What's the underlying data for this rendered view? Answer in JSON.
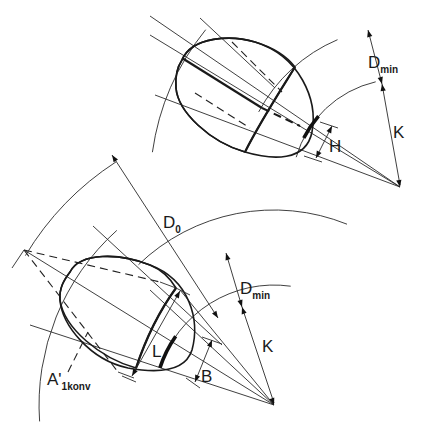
{
  "diagram": {
    "title": "",
    "colors": {
      "ink": "#1a1a1a",
      "shade": "#c9c9c9",
      "background": "#ffffff"
    },
    "top_view": {
      "labels": {
        "d_min": "D",
        "d_min_sub": "min",
        "k": "K",
        "h": "H"
      }
    },
    "bottom_view": {
      "labels": {
        "d_0": "D",
        "d_0_sub": "0",
        "d_min": "D",
        "d_min_sub": "min",
        "k": "K",
        "l": "L",
        "b": "B",
        "a_1konv": "A'",
        "a_1konv_sub": "1konv"
      }
    }
  }
}
